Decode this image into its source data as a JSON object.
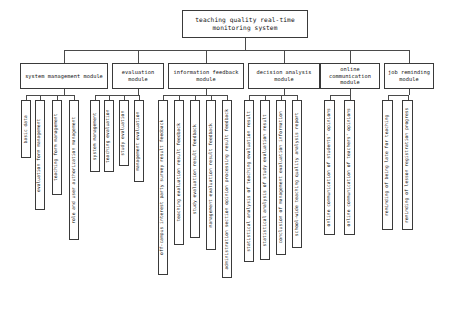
{
  "diagram": {
    "type": "tree",
    "root": {
      "label": "teaching quality real-time monitoring system"
    },
    "modules": [
      {
        "label": "system management module",
        "leaves": [
          "basic data",
          "evaluation form management",
          "teaching form management",
          "role and user authorization management"
        ]
      },
      {
        "label": "evaluation module",
        "leaves": [
          "system management",
          "teaching evaluation",
          "study evaluation",
          "management evaluation"
        ]
      },
      {
        "label": "information feedback module",
        "leaves": [
          "off-campus interest party survey result feedback",
          "teaching evaluation result feedback",
          "study evaluation result feedback",
          "management evaluation result feedback",
          "administration section opinion processing result feedback"
        ]
      },
      {
        "label": "decision analysis module",
        "leaves": [
          "statistical analysis of teaching evaluation result",
          "statistical analysis of study evaluation result",
          "conclusion of management evaluation information",
          "school-wide teaching quality analysis report"
        ]
      },
      {
        "label": "online communication module",
        "leaves": [
          "online communication of students' opinions",
          "online communication of teachers' opinions"
        ]
      },
      {
        "label": "job reminding module",
        "leaves": [
          "reminding of being late for teaching",
          "reminding of lesson registration progress"
        ]
      }
    ]
  },
  "colors": {
    "border": "#3a3a3a",
    "connector": "#4a4a4a",
    "background": "#ffffff",
    "text": "#111111"
  }
}
